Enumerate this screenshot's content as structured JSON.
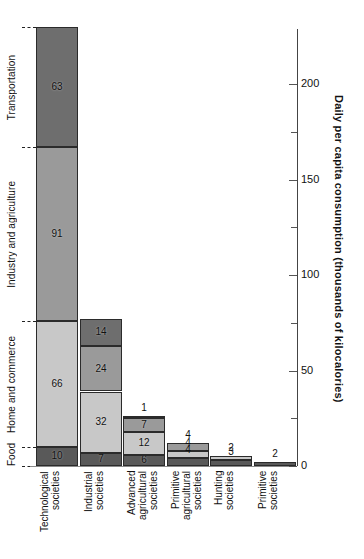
{
  "chart_data": {
    "type": "bar",
    "subtype": "stacked-bar",
    "title": "",
    "subtitle": "",
    "xlabel": "",
    "ylabel": "Daily per capita consumption (thousands of kilocalories)",
    "ylim": [
      0,
      240
    ],
    "yticks_major": [
      0,
      50,
      100,
      150,
      200
    ],
    "yticks_minor": [
      25,
      75,
      125,
      175,
      225
    ],
    "ytick_labels": [
      "0",
      "50",
      "100",
      "150",
      "200"
    ],
    "grid": false,
    "legend_position": "left-axis-brackets",
    "orientation": "vertical",
    "categories": [
      "Technological\nsocieties",
      "Industrial\nsocieties",
      "Advanced\nagricultural\nsocieties",
      "Primitive\nagricultural\nsocieties",
      "Hunting\nsocieties",
      "Primitive\nsocieties"
    ],
    "series": [
      {
        "name": "Food",
        "color": "#595959",
        "pattern": "solid",
        "values": [
          10,
          7,
          6,
          4,
          3,
          2
        ]
      },
      {
        "name": "Home and commerce",
        "color": "#c8c8c8",
        "pattern": "solid",
        "pattern_first_bar": "diagonal-hatch",
        "values": [
          66,
          32,
          12,
          4,
          2,
          0
        ]
      },
      {
        "name": "Industry and agriculture",
        "color": "#9a9a9a",
        "pattern": "solid",
        "pattern_first_bar": "diagonal-hatch",
        "values": [
          91,
          24,
          7,
          4,
          0,
          0
        ]
      },
      {
        "name": "Transportation",
        "color": "#6e6e6e",
        "pattern": "solid",
        "values": [
          63,
          14,
          1,
          0,
          0,
          0
        ]
      }
    ],
    "totals": [
      230,
      77,
      26,
      12,
      5,
      2
    ],
    "bar_value_labels": [
      [
        "10",
        "66",
        "91",
        "63"
      ],
      [
        "7",
        "32",
        "24",
        "14"
      ],
      [
        "6",
        "12",
        "7",
        "1"
      ],
      [
        "4",
        "4",
        "4"
      ],
      [
        "3",
        "2"
      ],
      [
        "2"
      ]
    ],
    "labels_outside_bar": [
      {
        "category": "Advanced agricultural societies",
        "series": "Transportation",
        "value": "1"
      },
      {
        "category": "Primitive agricultural societies",
        "series": "Industry and agriculture",
        "value": "4"
      },
      {
        "category": "Hunting societies",
        "series": "Home and commerce",
        "value": "2"
      },
      {
        "category": "Primitive societies",
        "series": "Food",
        "value": "2"
      }
    ]
  },
  "axis": {
    "ylabel": "Daily per capita consumption (thousands of kilocalories)",
    "ticks": [
      {
        "value": 200,
        "label": "200",
        "major": true
      },
      {
        "value": 175,
        "label": "",
        "major": false
      },
      {
        "value": 150,
        "label": "150",
        "major": true
      },
      {
        "value": 125,
        "label": "",
        "major": false
      },
      {
        "value": 100,
        "label": "100",
        "major": true
      },
      {
        "value": 75,
        "label": "",
        "major": false
      },
      {
        "value": 50,
        "label": "50",
        "major": true
      },
      {
        "value": 25,
        "label": "",
        "major": false
      },
      {
        "value": 0,
        "label": "0",
        "major": true
      }
    ]
  },
  "category_legend": {
    "items": [
      {
        "label": "Transportation",
        "color": "#6e6e6e"
      },
      {
        "label": "Industry and agriculture",
        "color": "#9a9a9a"
      },
      {
        "label": "Home and commerce",
        "color": "#c8c8c8"
      },
      {
        "label": "Food",
        "color": "#595959"
      }
    ]
  },
  "x_categories": [
    {
      "line1": "Technological",
      "line2": "societies",
      "line3": ""
    },
    {
      "line1": "Industrial",
      "line2": "societies",
      "line3": ""
    },
    {
      "line1": "Advanced",
      "line2": "agricultural",
      "line3": "societies"
    },
    {
      "line1": "Primitive",
      "line2": "agricultural",
      "line3": "societies"
    },
    {
      "line1": "Hunting",
      "line2": "societies",
      "line3": ""
    },
    {
      "line1": "Primitive",
      "line2": "societies",
      "line3": ""
    }
  ]
}
